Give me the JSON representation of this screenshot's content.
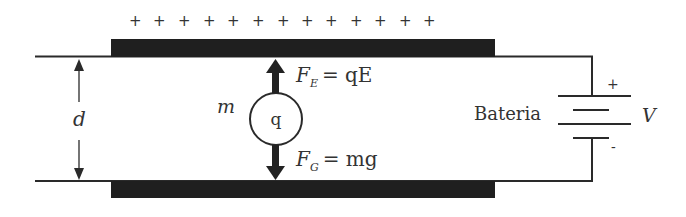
{
  "diagram": {
    "title": "",
    "top_plate_charges": [
      "+",
      "+",
      "+",
      "+",
      "+",
      "+",
      "+",
      "+",
      "+",
      "+",
      "+",
      "+",
      "+"
    ],
    "labels": {
      "distance": "d",
      "mass": "m",
      "charge": "q",
      "electric_force": "F",
      "electric_force_sub": "E",
      "electric_force_eq": "= qE",
      "gravity_force": "F",
      "gravity_force_sub": "G",
      "gravity_force_eq": "= mg",
      "battery": "Bateria",
      "voltage": "V",
      "battery_plus": "+",
      "battery_minus": "-"
    },
    "colors": {
      "plate": "#1f1f1f",
      "line": "#2a2a2a",
      "text": "#333333"
    }
  }
}
